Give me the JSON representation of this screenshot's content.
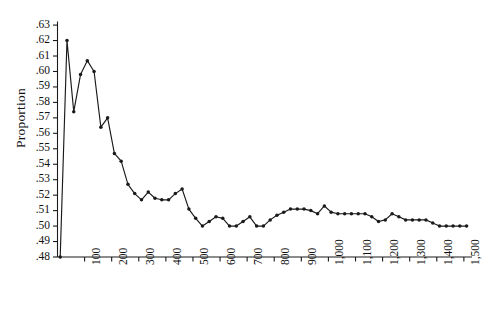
{
  "chart_data": {
    "type": "line",
    "title": "",
    "subtitle": "",
    "xlabel": "",
    "ylabel": "Proportion",
    "xlim": [
      0,
      1530
    ],
    "ylim": [
      0.48,
      0.632
    ],
    "grid": false,
    "legend": null,
    "marker": "filled-circle",
    "line_color": "#1a1a1a",
    "xticks": [
      100,
      200,
      300,
      400,
      500,
      600,
      700,
      800,
      900,
      1000,
      1100,
      1200,
      1300,
      1400,
      1500
    ],
    "xtick_labels": [
      "100",
      "200",
      "300",
      "400",
      "500",
      "600",
      "700",
      "800",
      "900",
      "1,000",
      "1,100",
      "1,200",
      "1,300",
      "1,400",
      "1,500"
    ],
    "yticks": [
      0.48,
      0.49,
      0.5,
      0.51,
      0.52,
      0.53,
      0.54,
      0.55,
      0.56,
      0.57,
      0.58,
      0.59,
      0.6,
      0.61,
      0.62,
      0.63
    ],
    "ytick_labels": [
      ".48",
      ".49",
      ".50",
      ".51",
      ".52",
      ".53",
      ".54",
      ".55",
      ".56",
      ".57",
      ".58",
      ".59",
      ".60",
      ".61",
      ".62",
      ".63"
    ],
    "series": [
      {
        "name": "proportion",
        "x": [
          10,
          35,
          60,
          85,
          110,
          135,
          160,
          185,
          210,
          235,
          260,
          285,
          310,
          335,
          360,
          385,
          410,
          435,
          460,
          485,
          510,
          535,
          560,
          585,
          610,
          635,
          660,
          685,
          710,
          735,
          760,
          785,
          810,
          835,
          860,
          885,
          910,
          935,
          960,
          985,
          1010,
          1035,
          1060,
          1085,
          1110,
          1135,
          1160,
          1185,
          1210,
          1235,
          1260,
          1285,
          1310,
          1335,
          1360,
          1385,
          1410,
          1435,
          1460,
          1485,
          1510
        ],
        "y": [
          0.48,
          0.62,
          0.574,
          0.598,
          0.607,
          0.6,
          0.564,
          0.57,
          0.547,
          0.542,
          0.527,
          0.521,
          0.517,
          0.522,
          0.518,
          0.517,
          0.517,
          0.521,
          0.524,
          0.511,
          0.505,
          0.5,
          0.503,
          0.506,
          0.505,
          0.5,
          0.5,
          0.503,
          0.506,
          0.5,
          0.5,
          0.504,
          0.507,
          0.509,
          0.511,
          0.511,
          0.511,
          0.51,
          0.508,
          0.513,
          0.509,
          0.508,
          0.508,
          0.508,
          0.508,
          0.508,
          0.506,
          0.503,
          0.504,
          0.508,
          0.506,
          0.504,
          0.504,
          0.504,
          0.504,
          0.502,
          0.5,
          0.5,
          0.5,
          0.5,
          0.5
        ]
      }
    ]
  }
}
